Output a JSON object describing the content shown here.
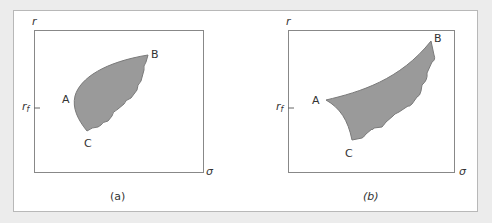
{
  "panels": [
    {
      "id": "a",
      "caption": "(a)",
      "y_axis_label": "r",
      "x_axis_label": "σ",
      "rf_label": "r",
      "rf_sub": "f",
      "points": {
        "A": "A",
        "B": "B",
        "C": "C"
      },
      "region_fill": "#9a9a9a"
    },
    {
      "id": "b",
      "caption": "(b)",
      "y_axis_label": "r",
      "x_axis_label": "σ",
      "rf_label": "r",
      "rf_sub": "f",
      "points": {
        "A": "A",
        "B": "B",
        "C": "C"
      },
      "region_fill": "#9a9a9a"
    }
  ],
  "colors": {
    "background": "#ececec",
    "frame_border": "#b8b8b8",
    "axis": "#888888",
    "region_fill": "#9a9a9a",
    "region_stroke": "#7a7a7a"
  }
}
